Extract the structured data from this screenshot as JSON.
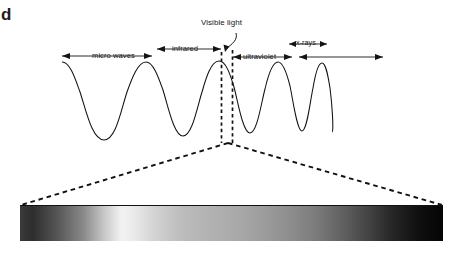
{
  "figure": {
    "letter": "d",
    "type": "electromagnetic-spectrum-diagram"
  },
  "labels": {
    "visible_light": "Visible light",
    "micro_waves": "micro waves",
    "infrared": "infrared",
    "ultraviolet": "ultraviolet",
    "xrays": "x-rays"
  },
  "chart_data": {
    "type": "line",
    "title": "",
    "xlabel": "",
    "ylabel": "",
    "regions": [
      {
        "name": "micro waves",
        "arrow": "double",
        "x_start": 60,
        "x_end": 160,
        "label_line": "lower"
      },
      {
        "name": "infrared",
        "arrow": "double",
        "x_start": 160,
        "x_end": 221,
        "label_line": "upper"
      },
      {
        "name": "visible light",
        "arrow": "callout",
        "x_start": 221,
        "x_end": 232,
        "label_line": "top"
      },
      {
        "name": "ultraviolet",
        "arrow": "double",
        "x_start": 232,
        "x_end": 293,
        "label_line": "lower"
      },
      {
        "name": "x-rays",
        "arrow": "double",
        "x_start": 296,
        "x_end": 334,
        "label_line": "upper"
      },
      {
        "name": "",
        "arrow": "double",
        "x_start": 336,
        "x_end": 383,
        "label_line": "lower"
      }
    ],
    "wave": {
      "baseline_y": 100,
      "amplitude": 40,
      "x_start": 62,
      "x_end": 332,
      "cycles_increasing": true,
      "stroke": "#111111"
    },
    "spectrum_bar": {
      "x": 20,
      "y": 205,
      "width": 423,
      "height": 35,
      "colorscale": "grayscale",
      "stops": [
        {
          "pos": 0,
          "color": "#3a3a3a"
        },
        {
          "pos": 0.24,
          "color": "#f2f2f2"
        },
        {
          "pos": 0.52,
          "color": "#a8a8a8"
        },
        {
          "pos": 0.82,
          "color": "#454545"
        },
        {
          "pos": 1,
          "color": "#050505"
        }
      ]
    },
    "callout_cone": {
      "apex_x": 228,
      "apex_y": 143,
      "left_x": 21,
      "left_y": 205,
      "right_x": 442,
      "right_y": 205,
      "style": "dashed"
    },
    "visible_band_lines": {
      "left_x": 221,
      "right_x": 232,
      "y_top": 52,
      "y_bottom": 143,
      "style": "dashed"
    },
    "grid": false,
    "legend": "none"
  },
  "colors": {
    "ink": "#161616",
    "wave_stroke": "#111111",
    "dashed": "#111111",
    "background": "#ffffff"
  }
}
